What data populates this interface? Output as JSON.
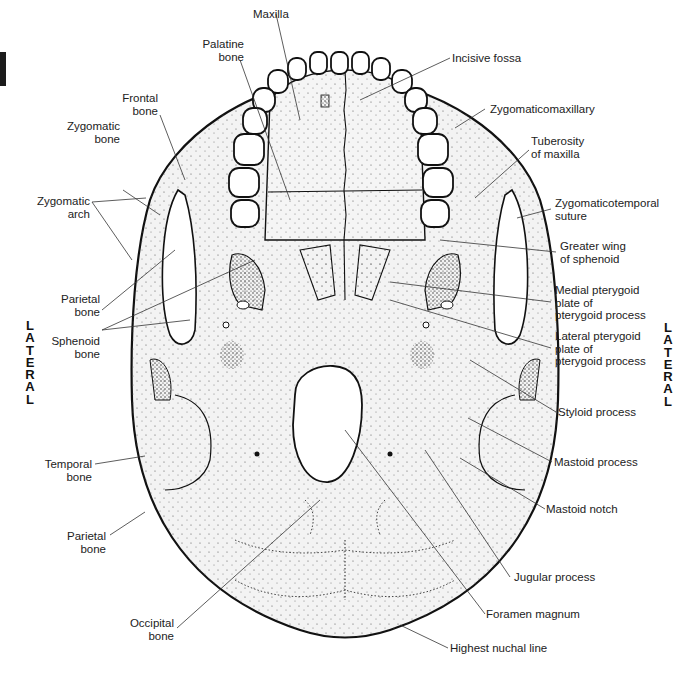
{
  "diagram": {
    "orientation": {
      "top": "ANTERIOR",
      "left": [
        "L",
        "A",
        "T",
        "E",
        "R",
        "A",
        "L"
      ],
      "right": [
        "L",
        "A",
        "T",
        "E",
        "R",
        "A",
        "L"
      ]
    },
    "labels_left": [
      {
        "id": "palatine",
        "lines": [
          "Palatine",
          "bone"
        ]
      },
      {
        "id": "frontal",
        "lines": [
          "Frontal",
          "bone"
        ]
      },
      {
        "id": "zygomatic-bone",
        "lines": [
          "Zygomatic",
          "bone"
        ]
      },
      {
        "id": "zygomatic-arch",
        "lines": [
          "Zygomatic",
          "arch"
        ]
      },
      {
        "id": "parietal-upper",
        "lines": [
          "Parietal",
          "bone"
        ]
      },
      {
        "id": "sphenoid",
        "lines": [
          "Sphenoid",
          "bone"
        ]
      },
      {
        "id": "temporal",
        "lines": [
          "Temporal",
          "bone"
        ]
      },
      {
        "id": "parietal-lower",
        "lines": [
          "Parietal",
          "bone"
        ]
      },
      {
        "id": "occipital",
        "lines": [
          "Occipital",
          "bone"
        ]
      }
    ],
    "labels_top": [
      {
        "id": "maxilla",
        "lines": [
          "Maxilla"
        ]
      }
    ],
    "labels_right": [
      {
        "id": "incisive-fossa",
        "lines": [
          "Incisive fossa"
        ]
      },
      {
        "id": "zygomaticomaxillary",
        "lines": [
          "Zygomaticomaxillary"
        ]
      },
      {
        "id": "tuberosity",
        "lines": [
          "Tuberosity",
          "of maxilla"
        ]
      },
      {
        "id": "zygomaticotemporal",
        "lines": [
          "Zygomaticotemporal",
          "suture"
        ]
      },
      {
        "id": "greater-wing",
        "lines": [
          "Greater wing",
          "of sphenoid"
        ]
      },
      {
        "id": "medial-pterygoid",
        "lines": [
          "Medial pterygoid",
          "plate of",
          "pterygoid process"
        ]
      },
      {
        "id": "lateral-pterygoid",
        "lines": [
          "Lateral pterygoid",
          "plate of",
          "pterygoid process"
        ]
      },
      {
        "id": "styloid",
        "lines": [
          "Styloid process"
        ]
      },
      {
        "id": "mastoid-process",
        "lines": [
          "Mastoid process"
        ]
      },
      {
        "id": "mastoid-notch",
        "lines": [
          "Mastoid notch"
        ]
      },
      {
        "id": "jugular",
        "lines": [
          "Jugular process"
        ]
      },
      {
        "id": "foramen-magnum",
        "lines": [
          "Foramen magnum"
        ]
      },
      {
        "id": "highest-nuchal",
        "lines": [
          "Highest nuchal line"
        ]
      }
    ],
    "colors": {
      "outline": "#111111",
      "bone_fill": "#f2f2f2",
      "stipple": "#333333",
      "leader": "#333333",
      "tab": "#1c1c1c"
    }
  }
}
